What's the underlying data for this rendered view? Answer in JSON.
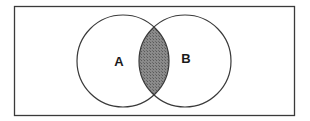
{
  "diagram": {
    "type": "venn",
    "sets": [
      {
        "id": "A",
        "label": "A"
      },
      {
        "id": "B",
        "label": "B"
      }
    ],
    "highlighted_region": "A ∩ B",
    "colors": {
      "background": "#ffffff",
      "outline": "#3a3a3a",
      "shading": "#7a7a7a"
    }
  }
}
